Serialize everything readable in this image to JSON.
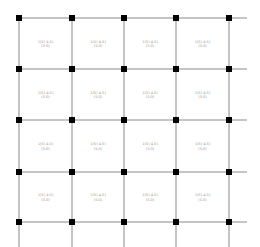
{
  "drawing": {
    "title": "Structural column grid plan",
    "grid": {
      "columns": 5,
      "rows": 5,
      "line_color": "#8a8a8a",
      "node_color": "#000000"
    },
    "panels": [
      {
        "row": 1,
        "col": 1,
        "line1": "1(5)   4.5)",
        "line2": "(5.0)"
      },
      {
        "row": 1,
        "col": 2,
        "line1": "1(5)   4.5)",
        "line2": "(5.0)"
      },
      {
        "row": 1,
        "col": 3,
        "line1": "1(5)   4.5)",
        "line2": "(5.0)"
      },
      {
        "row": 1,
        "col": 4,
        "line1": "1(5)   4.5)",
        "line2": "(5.0)"
      },
      {
        "row": 2,
        "col": 1,
        "line1": "1(5)   4.5)",
        "line2": "(5.0)"
      },
      {
        "row": 2,
        "col": 2,
        "line1": "1(5)   4.5)",
        "line2": "(5.0)"
      },
      {
        "row": 2,
        "col": 3,
        "line1": "1(5)   4.5)",
        "line2": "(5.0)"
      },
      {
        "row": 2,
        "col": 4,
        "line1": "1(5)   4.5)",
        "line2": "(5.0)"
      },
      {
        "row": 3,
        "col": 1,
        "line1": "1(5)   4.5)",
        "line2": "(5.0)"
      },
      {
        "row": 3,
        "col": 2,
        "line1": "1(5)   4.5)",
        "line2": "(5.0)"
      },
      {
        "row": 3,
        "col": 3,
        "line1": "1(5)   4.5)",
        "line2": "(5.0)"
      },
      {
        "row": 3,
        "col": 4,
        "line1": "1(5)   4.5)",
        "line2": "(5.0)"
      },
      {
        "row": 4,
        "col": 1,
        "line1": "1(5)   4.5)",
        "line2": "(5.0)"
      },
      {
        "row": 4,
        "col": 2,
        "line1": "1(5)   4.5)",
        "line2": "(5.0)"
      },
      {
        "row": 4,
        "col": 3,
        "line1": "1(5)   4.5)",
        "line2": "(5.0)"
      },
      {
        "row": 4,
        "col": 4,
        "line1": "1(5)   4.5)",
        "line2": "(5.0)"
      }
    ]
  }
}
